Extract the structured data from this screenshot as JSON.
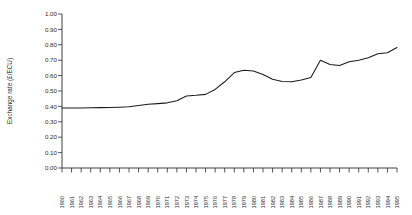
{
  "chart_data": {
    "type": "line",
    "title": "",
    "xlabel": "",
    "ylabel": "Exchange rate (£/ECU)",
    "ylim": [
      0.0,
      1.0
    ],
    "ytick_labels": [
      "1.00",
      "0.90",
      "0.80",
      "0.70",
      "0.60",
      "0.50",
      "0.40",
      "0.30",
      "0.20",
      "0.10",
      "0.00"
    ],
    "ytick_values": [
      1.0,
      0.9,
      0.8,
      0.7,
      0.6,
      0.5,
      0.4,
      0.3,
      0.2,
      0.1,
      0.0
    ],
    "grid": false,
    "legend": null,
    "categories": [
      "1960",
      "1961",
      "1962",
      "1963",
      "1964",
      "1965",
      "1966",
      "1967",
      "1968",
      "1969",
      "1970",
      "1971",
      "1972",
      "1973",
      "1974",
      "1975",
      "1976",
      "1977",
      "1978",
      "1979",
      "1980",
      "1981",
      "1982",
      "1983",
      "1984",
      "1985",
      "1986",
      "1987",
      "1988",
      "1989",
      "1990",
      "1991",
      "1992",
      "1993",
      "1994",
      "1995"
    ],
    "values": [
      0.39,
      0.39,
      0.39,
      0.391,
      0.392,
      0.393,
      0.395,
      0.398,
      0.406,
      0.414,
      0.418,
      0.423,
      0.437,
      0.468,
      0.472,
      0.478,
      0.51,
      0.56,
      0.62,
      0.635,
      0.63,
      0.607,
      0.576,
      0.562,
      0.56,
      0.572,
      0.588,
      0.7,
      0.672,
      0.666,
      0.69,
      0.7,
      0.716,
      0.742,
      0.748,
      0.782
    ]
  },
  "axis": {
    "y_label_text": "Exchange rate (£/ECU)"
  }
}
